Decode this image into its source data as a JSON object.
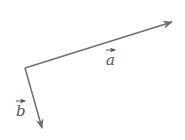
{
  "diagram": {
    "type": "vector-diagram",
    "origin": [
      25,
      68
    ],
    "color": "#6e6e6e",
    "vectors": [
      {
        "name": "a",
        "label": "a",
        "from": [
          25,
          68
        ],
        "to": [
          172,
          22
        ]
      },
      {
        "name": "b",
        "label": "b",
        "from": [
          25,
          68
        ],
        "to": [
          42,
          128
        ]
      }
    ]
  }
}
